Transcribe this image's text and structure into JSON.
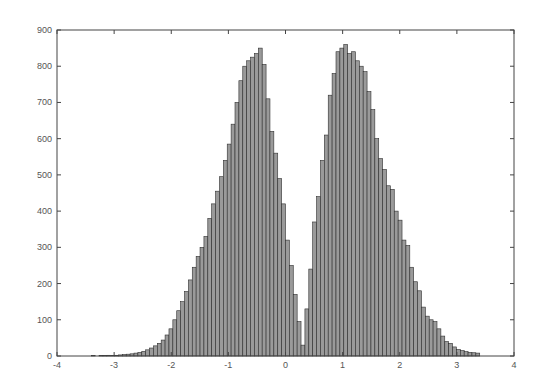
{
  "chart_data": {
    "type": "bar",
    "title": "",
    "xlabel": "",
    "ylabel": "",
    "xlim": [
      -4,
      4
    ],
    "ylim": [
      0,
      900
    ],
    "xticks": [
      -4,
      -3,
      -2,
      -1,
      0,
      1,
      2,
      3,
      4
    ],
    "yticks": [
      0,
      100,
      200,
      300,
      400,
      500,
      600,
      700,
      800,
      900
    ],
    "xtick_labels": [
      "-4",
      "-3",
      "-2",
      "-1",
      "0",
      "1",
      "2",
      "3",
      "4"
    ],
    "ytick_labels": [
      "0",
      "100",
      "200",
      "300",
      "400",
      "500",
      "600",
      "700",
      "800",
      "900"
    ],
    "grid": false,
    "legend": null,
    "bin_start": -3.4,
    "bin_width": 0.068,
    "bin_count": 100,
    "bar_color": "#9a9a9a",
    "edge_color": "#2e2e2e",
    "values": [
      1,
      0,
      1,
      1,
      2,
      1,
      2,
      3,
      4,
      5,
      6,
      8,
      10,
      13,
      17,
      22,
      28,
      35,
      44,
      58,
      75,
      100,
      125,
      150,
      178,
      210,
      245,
      275,
      300,
      330,
      380,
      420,
      455,
      495,
      540,
      585,
      640,
      700,
      760,
      800,
      815,
      825,
      835,
      850,
      805,
      710,
      620,
      560,
      490,
      420,
      320,
      250,
      170,
      95,
      30,
      130,
      240,
      370,
      440,
      540,
      610,
      720,
      780,
      840,
      850,
      860,
      835,
      840,
      815,
      800,
      785,
      730,
      680,
      600,
      545,
      515,
      470,
      460,
      400,
      375,
      320,
      305,
      245,
      205,
      180,
      135,
      110,
      100,
      95,
      75,
      55,
      40,
      35,
      25,
      18,
      15,
      12,
      10,
      9,
      8
    ]
  }
}
